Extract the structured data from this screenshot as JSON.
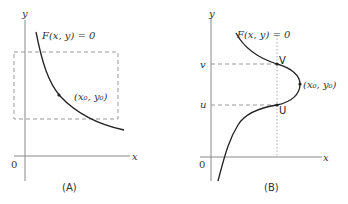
{
  "panel_a": {
    "caption": "(A)",
    "y_axis_label": "y",
    "x_axis_label": "x",
    "origin_label": "0",
    "curve_label": "F(x, y) = 0",
    "point_label": "(x₀, y₀)"
  },
  "panel_b": {
    "caption": "(B)",
    "y_axis_label": "y",
    "x_axis_label": "x",
    "origin_label": "0",
    "curve_label": "F(x, y) = 0",
    "point_label": "(x₀, y₀)",
    "tick_v": "v",
    "tick_u": "u",
    "point_v": "V",
    "point_u": "U"
  },
  "colors": {
    "axis": "#888888",
    "curve": "#222222",
    "dashed": "#999999",
    "dotted": "#aaaaaa"
  }
}
